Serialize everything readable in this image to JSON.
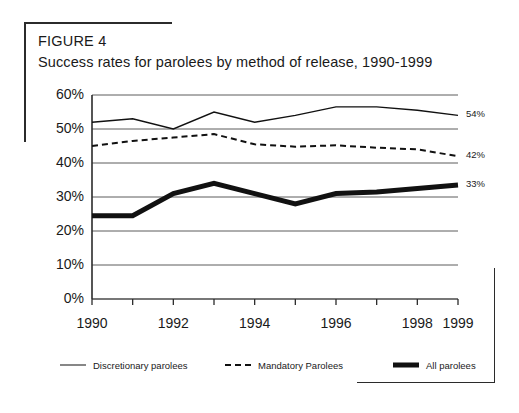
{
  "figure": {
    "label": "FIGURE 4",
    "title": "Success rates for parolees by method of release, 1990-1999"
  },
  "chart_data": {
    "type": "line",
    "title": "Success rates for parolees by method of release, 1990-1999",
    "xlabel": "",
    "ylabel": "",
    "grid": true,
    "legend_position": "bottom",
    "xlim": [
      1990,
      1999
    ],
    "ylim": [
      0,
      60
    ],
    "ytick_labels": [
      "0%",
      "10%",
      "20%",
      "30%",
      "40%",
      "50%",
      "60%"
    ],
    "ytick_values": [
      0,
      10,
      20,
      30,
      40,
      50,
      60
    ],
    "x": [
      1990,
      1991,
      1992,
      1993,
      1994,
      1995,
      1996,
      1997,
      1998,
      1999
    ],
    "xtick_labels": [
      "1990",
      "",
      "1992",
      "",
      "1994",
      "",
      "1996",
      "",
      "1998",
      "1999"
    ],
    "series": [
      {
        "name": "Discretionary parolees",
        "style": "thin-solid",
        "color": "#111111",
        "values": [
          52,
          53,
          50,
          55,
          52,
          54,
          56.5,
          56.5,
          55.5,
          54
        ],
        "end_label": "54%"
      },
      {
        "name": "Mandatory Parolees",
        "style": "dashed",
        "color": "#111111",
        "values": [
          45,
          46.5,
          47.5,
          48.5,
          45.5,
          44.8,
          45.2,
          44.5,
          44,
          42
        ],
        "end_label": "42%"
      },
      {
        "name": "All parolees",
        "style": "thick-solid",
        "color": "#111111",
        "values": [
          24.5,
          24.5,
          31,
          34,
          31,
          28,
          31,
          31.5,
          32.5,
          33.5
        ],
        "end_label": "33%"
      }
    ]
  },
  "legend": {
    "items": [
      {
        "label": "Discretionary parolees",
        "swatch": "thin-line-swatch"
      },
      {
        "label": "Mandatory Parolees",
        "swatch": "dashed-line-swatch"
      },
      {
        "label": "All parolees",
        "swatch": "thick-line-swatch"
      }
    ]
  }
}
